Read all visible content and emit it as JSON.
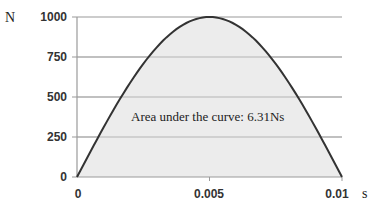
{
  "chart_data": {
    "type": "area",
    "title": "",
    "xlabel": "s",
    "ylabel": "N",
    "xlim": [
      0,
      0.01
    ],
    "ylim": [
      0,
      1000
    ],
    "x_ticks": [
      "0",
      "0.005",
      "0.01"
    ],
    "y_ticks": [
      "0",
      "250",
      "500",
      "750",
      "1000"
    ],
    "grid": {
      "horizontal": true,
      "vertical": false
    },
    "legend": null,
    "series": [
      {
        "name": "Force",
        "x": [
          0,
          0.001,
          0.002,
          0.003,
          0.004,
          0.005,
          0.006,
          0.007,
          0.008,
          0.009,
          0.01
        ],
        "values": [
          0,
          309,
          588,
          809,
          951,
          1000,
          951,
          809,
          588,
          309,
          0
        ]
      }
    ],
    "annotation": "Area under the curve: 6.31Ns",
    "colors": {
      "line": "#333333",
      "fill": "#ececec",
      "grid": "#9a9a9a"
    }
  },
  "labels": {
    "y_unit": "N",
    "x_unit": "s",
    "annotation": "Area under the curve: 6.31Ns",
    "y_ticks": [
      "1000",
      "750",
      "500",
      "250",
      "0"
    ],
    "x_ticks": [
      "0",
      "0.005",
      "0.01"
    ]
  }
}
